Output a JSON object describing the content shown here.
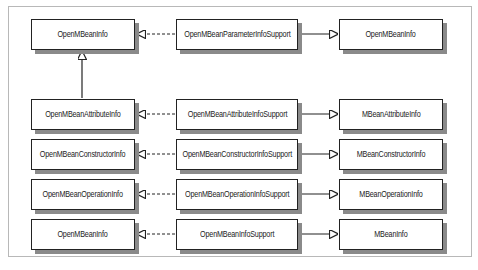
{
  "diagram": {
    "type": "class-hierarchy",
    "rows": [
      {
        "left": "OpenMBeanInfo",
        "middle": "OpenMBeanParameterInfoSupport",
        "right": "OpenMBeanInfo"
      },
      {
        "left": "OpenMBeanAttributeInfo",
        "middle": "OpenMBeanAttributeInfoSupport",
        "right": "MBeanAttributeInfo"
      },
      {
        "left": "OpenMBeanConstructorInfo",
        "middle": "OpenMBeanConstructorInfoSupport",
        "right": "MBeanConstructorInfo"
      },
      {
        "left": "OpenMBeanOperationInfo",
        "middle": "OpenMBeanOperationInfoSupport",
        "right": "MBeanOperationInfo"
      },
      {
        "left": "OpenMBeanInfo",
        "middle": "OpenMBeanInfoSupport",
        "right": "MBeanInfo"
      }
    ],
    "relations": {
      "middle_to_left": "realization (dashed line, hollow arrowhead)",
      "middle_to_right": "generalization (solid line, hollow arrowhead)",
      "left_row2_to_left_row1": "generalization (solid line, hollow arrowhead)"
    },
    "colors": {
      "border": "#222222",
      "shadow": "#8a8a8a",
      "frame": "#b8b8b8"
    }
  }
}
